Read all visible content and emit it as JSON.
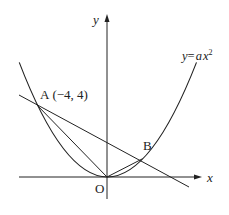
{
  "diagram": {
    "axes": {
      "x_label": "x",
      "y_label": "y",
      "origin_label": "O"
    },
    "curve": {
      "equation_label_y": "y",
      "equation_label_eq": "=",
      "equation_label_a": "a",
      "equation_label_x": "x",
      "equation_label_exp": "2"
    },
    "points": {
      "A": {
        "name": "A",
        "coords": "(−4, 4)"
      },
      "B": {
        "name": "B"
      }
    },
    "colors": {
      "stroke": "#222222",
      "background": "#ffffff"
    }
  }
}
